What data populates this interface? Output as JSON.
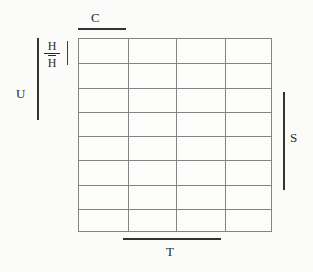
{
  "figure": {
    "type": "schematic-grid-diagram",
    "background_color": "#fbfbf9",
    "grid": {
      "columns": 4,
      "rows": 8,
      "line_color": "#848484",
      "cell_fill": "#fdfdfc",
      "cells": [
        [
          "",
          "",
          "",
          ""
        ],
        [
          "",
          "",
          "",
          ""
        ],
        [
          "",
          "",
          "",
          ""
        ],
        [
          "",
          "",
          "",
          ""
        ],
        [
          "",
          "",
          "",
          ""
        ],
        [
          "",
          "",
          "",
          ""
        ],
        [
          "",
          "",
          "",
          ""
        ],
        [
          "",
          "",
          "",
          ""
        ]
      ]
    },
    "bar_color": "#333333",
    "labels": {
      "c": "C",
      "u": "U",
      "s": "S",
      "t": "T",
      "h_numerator": "H",
      "h_denominator": "H"
    },
    "brackets": {
      "c_span_label": "top-bar-over-first-column",
      "u_span_label": "left-bar-spanning-upper-rows",
      "h_span_label": "left-bar-spanning-first-two-rows",
      "s_span_label": "right-bar-spanning-middle-rows",
      "t_span_label": "bottom-bar-spanning-middle-columns"
    }
  }
}
